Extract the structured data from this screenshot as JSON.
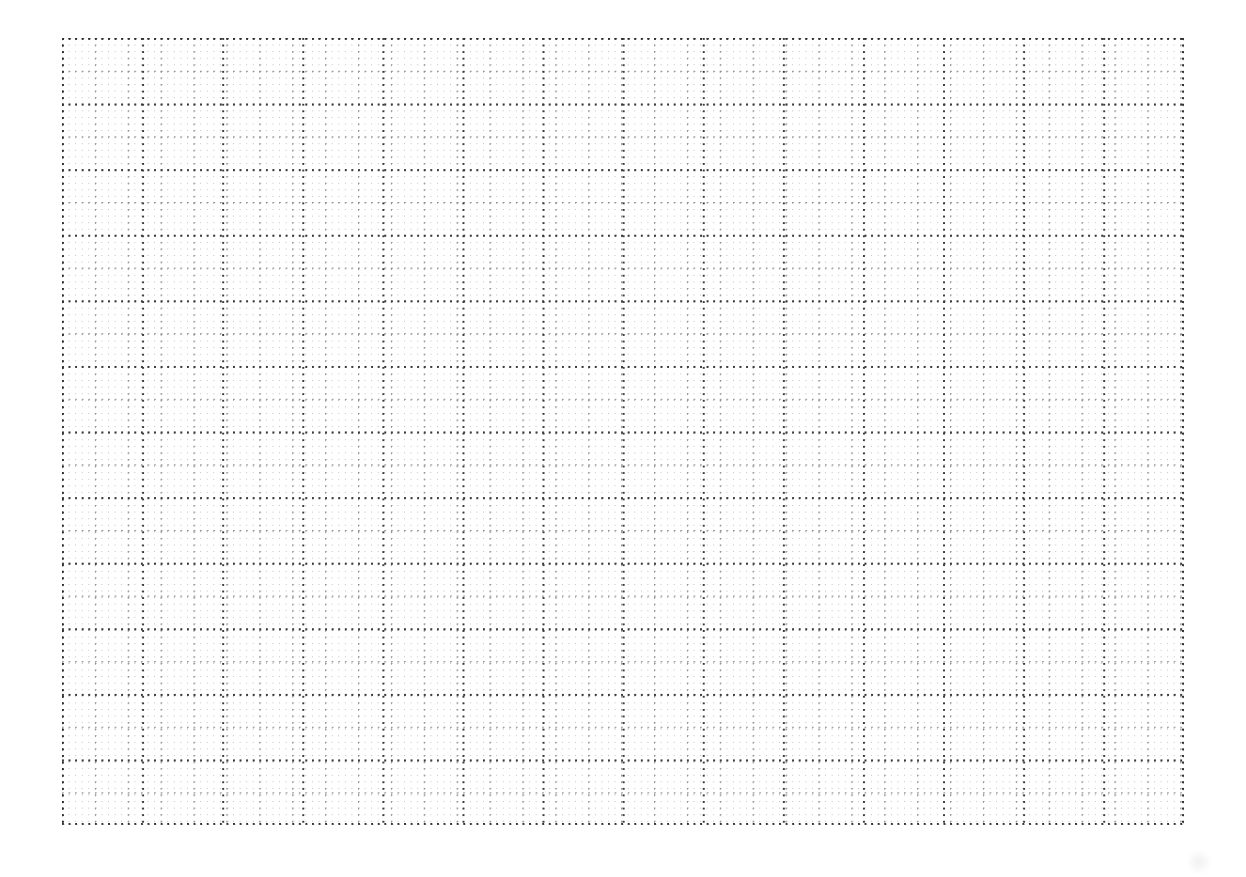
{
  "page": {
    "kind": "dotted-grid-paper",
    "width": 1246,
    "height": 877,
    "background_color": "#ffffff",
    "caption": "",
    "title": "",
    "visible_text": []
  },
  "grid": {
    "label": "",
    "left": 62,
    "top": 38,
    "width": 1122,
    "height": 787,
    "minor": {
      "label": "",
      "cell_px": 6.58,
      "dot_color": "#b9b9b9",
      "dot_radius_px": 0.55
    },
    "medium": {
      "label": "",
      "cell_x_px": 32.9,
      "cell_y_px": 32.8,
      "dot_color": "#8e8e8e",
      "dot_radius_px": 0.7
    },
    "heavy": {
      "label": "",
      "cell_x_px": 80.1,
      "cell_y_px": 65.6,
      "dot_color": "#3a3a3a",
      "dot_radius_px": 0.95
    },
    "border": {
      "label": "",
      "dot_color": "#2e2e2e",
      "dot_radius_px": 1.05
    }
  },
  "artifact": {
    "label": "",
    "left": 1186,
    "top": 849,
    "size": 26,
    "color": "#787878"
  }
}
